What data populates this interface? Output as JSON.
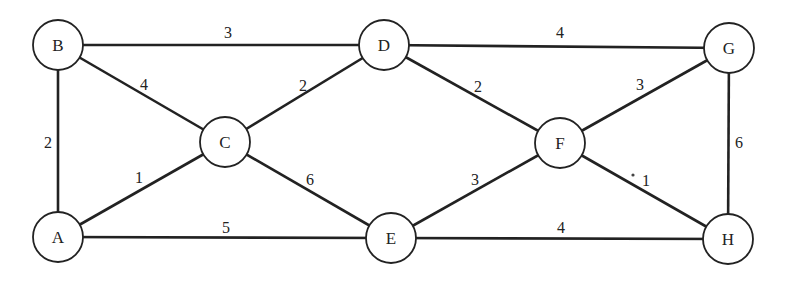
{
  "graph": {
    "type": "weighted-undirected-graph",
    "node_radius": 25,
    "nodes": [
      {
        "id": "A",
        "label": "A",
        "x": 58,
        "y": 237
      },
      {
        "id": "B",
        "label": "B",
        "x": 58,
        "y": 45
      },
      {
        "id": "C",
        "label": "C",
        "x": 225,
        "y": 142
      },
      {
        "id": "D",
        "label": "D",
        "x": 384,
        "y": 45
      },
      {
        "id": "E",
        "label": "E",
        "x": 391,
        "y": 238
      },
      {
        "id": "F",
        "label": "F",
        "x": 560,
        "y": 143
      },
      {
        "id": "G",
        "label": "G",
        "x": 729,
        "y": 48
      },
      {
        "id": "H",
        "label": "H",
        "x": 728,
        "y": 239
      }
    ],
    "edges": [
      {
        "from": "B",
        "to": "D",
        "weight": "3",
        "lx": 228,
        "ly": 38
      },
      {
        "from": "D",
        "to": "G",
        "weight": "4",
        "lx": 560,
        "ly": 38
      },
      {
        "from": "B",
        "to": "C",
        "weight": "4",
        "lx": 144,
        "ly": 90
      },
      {
        "from": "C",
        "to": "D",
        "weight": "2",
        "lx": 303,
        "ly": 91
      },
      {
        "from": "D",
        "to": "F",
        "weight": "2",
        "lx": 478,
        "ly": 92
      },
      {
        "from": "F",
        "to": "G",
        "weight": "3",
        "lx": 640,
        "ly": 90
      },
      {
        "from": "B",
        "to": "A",
        "weight": "2",
        "lx": 48,
        "ly": 148
      },
      {
        "from": "G",
        "to": "H",
        "weight": "6",
        "lx": 739,
        "ly": 148
      },
      {
        "from": "A",
        "to": "C",
        "weight": "1",
        "lx": 139,
        "ly": 183
      },
      {
        "from": "C",
        "to": "E",
        "weight": "6",
        "lx": 310,
        "ly": 185
      },
      {
        "from": "E",
        "to": "F",
        "weight": "3",
        "lx": 475,
        "ly": 185
      },
      {
        "from": "F",
        "to": "H",
        "weight": "1",
        "lx": 646,
        "ly": 186
      },
      {
        "from": "A",
        "to": "E",
        "weight": "5",
        "lx": 226,
        "ly": 233
      },
      {
        "from": "E",
        "to": "H",
        "weight": "4",
        "lx": 561,
        "ly": 233
      }
    ],
    "artifacts": [
      {
        "type": "dot",
        "x": 633,
        "y": 175,
        "r": 1.6
      }
    ],
    "colors": {
      "stroke": "#222222",
      "fill": "#ffffff",
      "background": "#ffffff"
    }
  }
}
